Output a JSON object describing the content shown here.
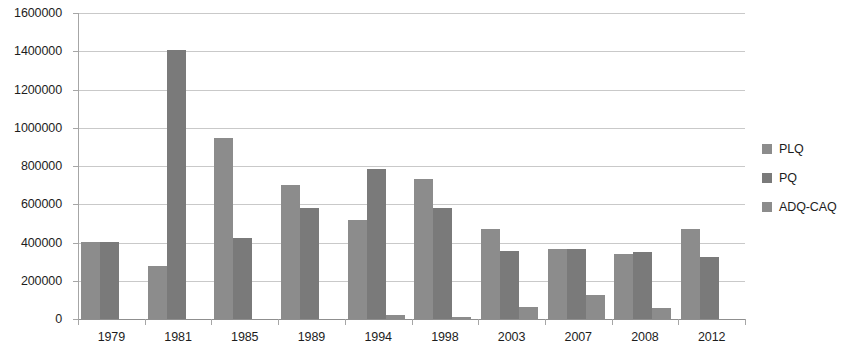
{
  "chart_data": {
    "type": "bar",
    "title": "",
    "subtitle": "",
    "xlabel": "",
    "ylabel": "",
    "grid": true,
    "legend_position": "right",
    "ylim": [
      0,
      1600000
    ],
    "ytick_step": 200000,
    "ytick_labels": [
      "1600000",
      "1400000",
      "1200000",
      "1000000",
      "800000",
      "600000",
      "400000",
      "200000",
      "0"
    ],
    "ytick_values": [
      1600000,
      1400000,
      1200000,
      1000000,
      800000,
      600000,
      400000,
      200000,
      0
    ],
    "categories": [
      "1979",
      "1981",
      "1985",
      "1989",
      "1994",
      "1998",
      "2003",
      "2007",
      "2008",
      "2012"
    ],
    "series": [
      {
        "name": "PLQ",
        "color": "#8c8c8c",
        "values": [
          405000,
          275000,
          945000,
          700000,
          520000,
          730000,
          470000,
          365000,
          340000,
          470000
        ]
      },
      {
        "name": "PQ",
        "color": "#7a7a7a",
        "values": [
          402000,
          1405000,
          425000,
          580000,
          782000,
          580000,
          355000,
          368000,
          352000,
          322000
        ]
      },
      {
        "name": "ADQ-CAQ",
        "color": "#8c8c8c",
        "values": [
          0,
          0,
          0,
          0,
          22000,
          12000,
          65000,
          125000,
          55000,
          0
        ]
      }
    ]
  },
  "legend": {
    "items": [
      {
        "label": "PLQ",
        "color": "#8c8c8c"
      },
      {
        "label": "PQ",
        "color": "#7a7a7a"
      },
      {
        "label": "ADQ-CAQ",
        "color": "#8c8c8c"
      }
    ]
  },
  "colors": {
    "plq": "#8c8c8c",
    "pq": "#7a7a7a",
    "adq_caq": "#8c8c8c",
    "gridline": "#c9c9c9",
    "axis": "#a6a6a6",
    "text": "#1d1d1d",
    "background": "#ffffff"
  }
}
